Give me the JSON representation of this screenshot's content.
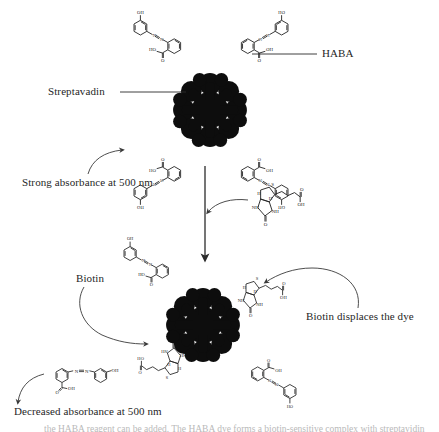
{
  "figure": {
    "background_color": "#ffffff",
    "ink_color": "#1a1a1a",
    "blob_color": "#0d0d0d"
  },
  "labels": {
    "haba": "HABA",
    "streptavidin": "Streptavadin",
    "strong_absorbance": "Strong absorbance at 500 nm",
    "biotin": "Biotin",
    "biotin_displaces": "Biotin displaces the dye",
    "decreased_absorbance": "Decreased absorbance at 500 nm",
    "cut_caption": "the HABA reagent can be added. The HABA dye forms a biotin-sensitive complex with streptavidin"
  },
  "atom_labels": {
    "hydroxyl": "OH",
    "hydroxyl_reversed": "HO",
    "oxygen": "O",
    "nitrogen": "N",
    "sulfur": "S",
    "hydrogen": "H",
    "amine_nh": "NH",
    "amine_hn": "HN",
    "amine_h_n": "H₁N",
    "carboxyl": "OH",
    "azo_left": "N",
    "azo_right": "N"
  },
  "panels": {
    "top": {
      "name": "streptavidin-haba-complex",
      "description": "Streptavidin with four HABA dye molecules bound",
      "haba_count": 4,
      "biotin_count": 0,
      "absorbance_state": "strong"
    },
    "bottom": {
      "name": "streptavidin-biotin-complex",
      "description": "Streptavidin with two biotin molecules bound and two HABA dyes remaining",
      "haba_count": 2,
      "biotin_count": 2,
      "absorbance_state": "decreased"
    }
  },
  "reaction": {
    "arrow_direction": "down",
    "reagent_name": "biotin",
    "released_species": "HABA dye"
  },
  "chemistry": {
    "haba_full_name": "2-(4-hydroxyphenylazo)benzoic acid",
    "wavelength_nm": "500",
    "wavelength_label": "500 nm"
  }
}
